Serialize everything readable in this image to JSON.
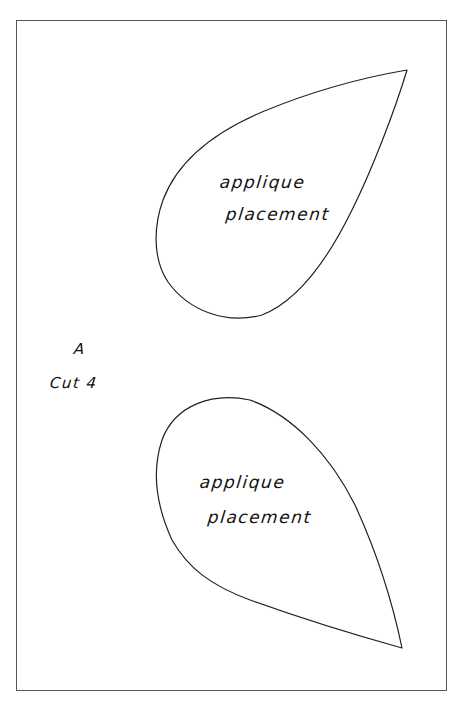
{
  "page": {
    "type": "sewing-pattern-template",
    "background": "#ffffff",
    "line_color": "#222222",
    "border_color": "#555555"
  },
  "piece_label": {
    "letter": "A",
    "instruction": "Cut 4"
  },
  "shapes": [
    {
      "id": "top-teardrop",
      "shape": "teardrop",
      "tip_direction": "upper-right",
      "label_line1": "applique",
      "label_line2": "placement"
    },
    {
      "id": "bottom-teardrop",
      "shape": "teardrop",
      "tip_direction": "lower-right",
      "label_line1": "applique",
      "label_line2": "placement"
    }
  ]
}
